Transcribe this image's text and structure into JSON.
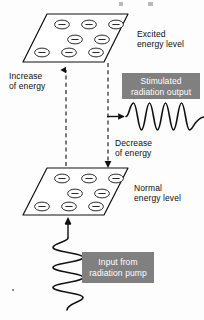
{
  "diagram": {
    "background_color": "#fdfdfd",
    "line_color": "#111111",
    "box_fill_color": "#808080",
    "box_text_color": "#ffffff"
  },
  "labels": {
    "excited_level": "Excited\nenergy level",
    "excited_level_line1": "Excited",
    "excited_level_line2": "energy level",
    "normal_level_line1": "Normal",
    "normal_level_line2": "energy level",
    "increase_line1": "Increase",
    "increase_line2": "of energy",
    "decrease_line1": "Decrease",
    "decrease_line2": "of energy"
  },
  "boxes": {
    "stimulated_output": {
      "line1": "Stimulated",
      "line2": "radiation output",
      "fill": "#808080",
      "text_color": "#ffffff"
    },
    "radiation_pump": {
      "line1": "Input from",
      "line2": "radiation pump",
      "fill": "#808080",
      "text_color": "#ffffff"
    }
  },
  "planes": {
    "excited": {
      "name": "excited-energy-plane",
      "electron_count": 8,
      "electron_symbol": "−",
      "rows": [
        3,
        2,
        3
      ]
    },
    "normal": {
      "name": "normal-energy-plane",
      "electron_count": 8,
      "electron_symbol": "−",
      "rows": [
        3,
        2,
        3
      ]
    }
  },
  "waves": {
    "output_wave": {
      "orientation": "horizontal",
      "cycles": 3
    },
    "pump_wave": {
      "orientation": "vertical",
      "cycles": 3
    }
  },
  "arrows": {
    "increase_arrow": "up",
    "decrease_arrow": "down",
    "output_arrow": "right",
    "pump_arrow": "up"
  }
}
